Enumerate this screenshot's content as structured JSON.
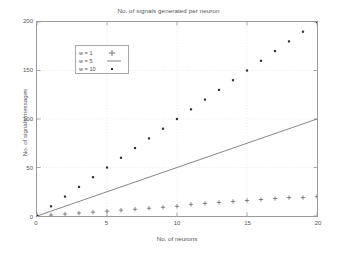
{
  "chart_data": {
    "type": "scatter",
    "title": "No. of signals generated per neuron",
    "xlabel": "No. of neurons",
    "ylabel": "No. of signals/messages",
    "xlim": [
      0,
      20
    ],
    "ylim": [
      0,
      200
    ],
    "xticks": [
      0,
      5,
      10,
      15,
      20
    ],
    "yticks": [
      0,
      50,
      100,
      150,
      200
    ],
    "grid": true,
    "legend_position": "top-left",
    "x": [
      0,
      1,
      2,
      3,
      4,
      5,
      6,
      7,
      8,
      9,
      10,
      11,
      12,
      13,
      14,
      15,
      16,
      17,
      18,
      19,
      20
    ],
    "series": [
      {
        "name": "w = 1",
        "marker": "plus",
        "style": "points",
        "color": "#555555",
        "values": [
          0,
          1,
          2,
          3,
          4,
          5,
          6,
          7,
          8,
          9,
          10,
          12,
          13,
          14,
          15,
          16,
          17,
          18,
          19,
          19,
          20
        ]
      },
      {
        "name": "w = 5",
        "marker": "line",
        "style": "line",
        "color": "#666666",
        "values": [
          0,
          5,
          10,
          15,
          20,
          25,
          30,
          35,
          40,
          45,
          50,
          55,
          60,
          65,
          70,
          75,
          80,
          85,
          90,
          95,
          100
        ]
      },
      {
        "name": "w = 10",
        "marker": "dot",
        "style": "points",
        "color": "#333333",
        "values": [
          0,
          10,
          20,
          30,
          40,
          50,
          60,
          70,
          80,
          90,
          100,
          110,
          120,
          130,
          140,
          150,
          160,
          170,
          180,
          190,
          200
        ]
      }
    ]
  },
  "legend": {
    "items": [
      {
        "label": "w = 1",
        "marker": "plus-marker"
      },
      {
        "label": "w = 5",
        "marker": "line-marker"
      },
      {
        "label": "w = 10",
        "marker": "dot-marker"
      }
    ]
  },
  "axes": {
    "xticklabels": [
      "0",
      "5",
      "10",
      "15",
      "20"
    ],
    "yticklabels": [
      "0",
      "50",
      "100",
      "150",
      "200"
    ]
  }
}
